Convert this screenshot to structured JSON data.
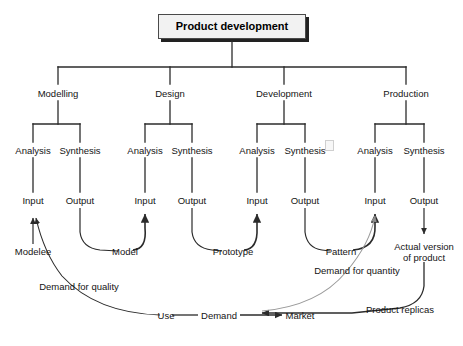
{
  "diagram": {
    "title": "Product development",
    "root_label": "Product development",
    "phases": [
      {
        "label": "Modelling",
        "analysis": "Analysis",
        "synthesis": "Synthesis",
        "input": "Input",
        "output": "Output",
        "input_artifact": "Modelee",
        "output_artifact": "Model"
      },
      {
        "label": "Design",
        "analysis": "Analysis",
        "synthesis": "Synthesis",
        "input": "Input",
        "output": "Output",
        "input_artifact": "Model",
        "output_artifact": "Prototype"
      },
      {
        "label": "Development",
        "analysis": "Analysis",
        "synthesis": "Synthesis",
        "input": "Input",
        "output": "Output",
        "input_artifact": "Prototype",
        "output_artifact": "Pattern"
      },
      {
        "label": "Production",
        "analysis": "Analysis",
        "synthesis": "Synthesis",
        "input": "Input",
        "output": "Output",
        "input_artifact": "Pattern",
        "output_artifact": "Actual version of product"
      }
    ],
    "artifacts": {
      "modelee": "Modelee",
      "model": "Model",
      "prototype": "Prototype",
      "pattern": "Pattern",
      "actual_version_line1": "Actual version",
      "actual_version_line2": "of product"
    },
    "feedback": {
      "demand_for_quality": "Demand for quality",
      "demand_for_quantity": "Demand for quantity",
      "product_replicas": "Product replicas"
    },
    "market_cycle": {
      "use": "Use",
      "demand": "Demand",
      "market": "Market"
    },
    "caption": "",
    "colors": {
      "line": "#2b2b2b",
      "thin_line": "#9a9a9a",
      "box_fill": "#f2f2f2",
      "box_border": "#4a4a4a",
      "box_shadow": "#222222",
      "text": "#141414"
    }
  }
}
